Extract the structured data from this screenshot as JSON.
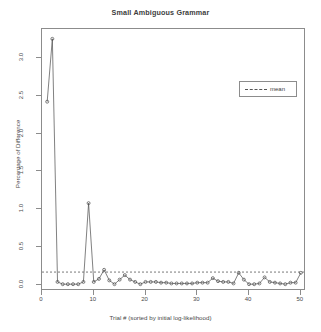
{
  "chart_data": {
    "type": "line",
    "title": "Small Ambiguous Grammar",
    "xlabel": "Trial # (sorted by initial log-likelihood)",
    "ylabel": "Percentage of Difference",
    "xlim": [
      0,
      51
    ],
    "ylim": [
      -0.08,
      3.38
    ],
    "grid": false,
    "legend_position": "upper right",
    "legend_entries": [
      {
        "label": "mean",
        "style": "dashed",
        "color": "#555555"
      }
    ],
    "series": [
      {
        "name": "Percentage of Difference",
        "style": "line-with-points",
        "color": "#4a4a4a",
        "x": [
          1,
          2,
          3,
          4,
          5,
          6,
          7,
          8,
          9,
          10,
          11,
          12,
          13,
          14,
          15,
          16,
          17,
          18,
          19,
          20,
          21,
          22,
          23,
          24,
          25,
          26,
          27,
          28,
          29,
          30,
          31,
          32,
          33,
          34,
          35,
          36,
          37,
          38,
          39,
          40,
          41,
          42,
          43,
          44,
          45,
          46,
          47,
          48,
          49,
          50
        ],
        "values": [
          2.42,
          3.25,
          0.04,
          0.01,
          0.01,
          0.01,
          0.01,
          0.04,
          1.08,
          0.04,
          0.08,
          0.2,
          0.06,
          0.01,
          0.07,
          0.13,
          0.07,
          0.04,
          0.01,
          0.04,
          0.04,
          0.04,
          0.03,
          0.03,
          0.02,
          0.02,
          0.02,
          0.02,
          0.02,
          0.03,
          0.03,
          0.03,
          0.09,
          0.05,
          0.04,
          0.04,
          0.02,
          0.16,
          0.07,
          0.01,
          0.01,
          0.02,
          0.1,
          0.04,
          0.03,
          0.02,
          0.01,
          0.03,
          0.03,
          0.16
        ]
      }
    ],
    "annotations": [
      {
        "type": "hline",
        "name": "mean-line",
        "value": 0.17,
        "style": "dashed",
        "color": "#555555"
      }
    ],
    "xticks": [
      {
        "value": 0,
        "label": "0"
      },
      {
        "value": 10,
        "label": "10"
      },
      {
        "value": 20,
        "label": "20"
      },
      {
        "value": 30,
        "label": "30"
      },
      {
        "value": 40,
        "label": "40"
      },
      {
        "value": 50,
        "label": "50"
      }
    ],
    "yticks": [
      {
        "value": 0.0,
        "label": "0.0"
      },
      {
        "value": 0.5,
        "label": "0.5"
      },
      {
        "value": 1.0,
        "label": "1.0"
      },
      {
        "value": 1.5,
        "label": "1.5"
      },
      {
        "value": 2.0,
        "label": "2.0"
      },
      {
        "value": 2.5,
        "label": "2.5"
      },
      {
        "value": 3.0,
        "label": "3.0"
      }
    ]
  }
}
